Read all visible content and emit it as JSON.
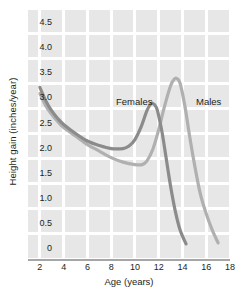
{
  "chart_data": {
    "type": "line",
    "title": "",
    "xlabel": "Age (years)",
    "ylabel": "Height gain (inches/year)",
    "xlim": [
      1,
      18
    ],
    "ylim": [
      0,
      5.0
    ],
    "grid": true,
    "legend_position": "inline-annotation",
    "xticks": [
      "2",
      "4",
      "6",
      "8",
      "10",
      "12",
      "14",
      "16",
      "18"
    ],
    "xtick_values": [
      2,
      4,
      6,
      8,
      10,
      12,
      14,
      16,
      18
    ],
    "yticks": [
      "0",
      "0.5",
      "1.0",
      "1.5",
      "2.0",
      "2.5",
      "3.0",
      "3.5",
      "4.0",
      "4.5",
      "5.0"
    ],
    "ytick_values": [
      0,
      0.5,
      1.0,
      1.5,
      2.0,
      2.5,
      3.0,
      3.5,
      4.0,
      4.5,
      5.0
    ],
    "series": [
      {
        "name": "Females",
        "color": "#8b8b8b",
        "annotation": "Females",
        "x": [
          2.0,
          2.5,
          3.0,
          3.5,
          4.0,
          5.0,
          6.0,
          7.0,
          8.0,
          9.0,
          9.5,
          10.0,
          10.5,
          11.0,
          11.3,
          11.5,
          11.8,
          12.0,
          12.3,
          12.6,
          13.0,
          13.4,
          13.8,
          14.3
        ],
        "y": [
          3.42,
          3.15,
          2.95,
          2.8,
          2.68,
          2.5,
          2.35,
          2.26,
          2.2,
          2.2,
          2.25,
          2.38,
          2.62,
          2.95,
          3.08,
          3.1,
          3.02,
          2.85,
          2.5,
          2.05,
          1.45,
          0.95,
          0.58,
          0.3
        ]
      },
      {
        "name": "Males",
        "color": "#b0b0b0",
        "annotation": "Males",
        "x": [
          2.0,
          2.5,
          3.0,
          3.5,
          4.0,
          5.0,
          6.0,
          7.0,
          8.0,
          9.0,
          10.0,
          10.6,
          11.0,
          11.5,
          12.0,
          12.5,
          13.0,
          13.3,
          13.5,
          13.8,
          14.2,
          14.6,
          15.0,
          15.5,
          16.0,
          16.5,
          17.0
        ],
        "y": [
          3.3,
          3.05,
          2.88,
          2.74,
          2.62,
          2.45,
          2.28,
          2.15,
          2.02,
          1.93,
          1.88,
          1.88,
          1.95,
          2.18,
          2.58,
          3.05,
          3.45,
          3.58,
          3.6,
          3.5,
          3.05,
          2.45,
          1.9,
          1.3,
          0.9,
          0.58,
          0.32
        ]
      }
    ],
    "annotations": [
      {
        "text": "Females",
        "x": 9.6,
        "y": 3.18
      },
      {
        "text": "Males",
        "x": 16.0,
        "y": 3.18
      }
    ],
    "peaks": [
      {
        "series": "Females",
        "age": 11.5,
        "height_gain": 3.1
      },
      {
        "series": "Males",
        "age": 13.5,
        "height_gain": 3.6
      }
    ],
    "colors": {
      "plot_background": "#e7e7e7",
      "gridline": "#ffffff",
      "axis_line": "#a6a6a6",
      "text": "#231f20",
      "females": "#8b8b8b",
      "males": "#b0b0b0"
    }
  }
}
